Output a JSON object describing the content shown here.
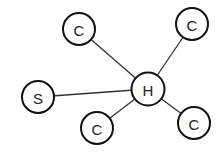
{
  "diagram": {
    "type": "star-graph",
    "center": "H",
    "nodes": [
      {
        "id": "H",
        "label": "H",
        "x": 148,
        "y": 89,
        "r": 16.5
      },
      {
        "id": "C1",
        "label": "C",
        "x": 79,
        "y": 29,
        "r": 16
      },
      {
        "id": "C2",
        "label": "C",
        "x": 192,
        "y": 24,
        "r": 16
      },
      {
        "id": "S",
        "label": "S",
        "x": 38,
        "y": 97,
        "r": 16
      },
      {
        "id": "C3",
        "label": "C",
        "x": 97,
        "y": 128,
        "r": 16
      },
      {
        "id": "C4",
        "label": "C",
        "x": 194,
        "y": 123,
        "r": 16
      }
    ],
    "edges": [
      {
        "from": "H",
        "to": "C1"
      },
      {
        "from": "H",
        "to": "C2"
      },
      {
        "from": "H",
        "to": "S"
      },
      {
        "from": "H",
        "to": "C3"
      },
      {
        "from": "H",
        "to": "C4"
      }
    ],
    "colors": {
      "background": "#ffffff",
      "stroke": "#111111",
      "text": "#222222"
    }
  }
}
